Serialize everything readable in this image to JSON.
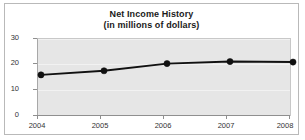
{
  "chart_data": {
    "type": "line",
    "title": "Net Income History",
    "subtitle": "(in millions of dollars)",
    "title_line1": "Net Income History",
    "title_line2": "(in millions of dollars)",
    "xlabel": "",
    "ylabel": "",
    "categories": [
      "2004",
      "2005",
      "2006",
      "2007",
      "2008"
    ],
    "values": [
      16.8,
      18.4,
      21.2,
      22.0,
      21.8
    ],
    "series": [
      {
        "name": "Net Income",
        "values": [
          16.8,
          18.4,
          21.2,
          22.0,
          21.8
        ]
      }
    ],
    "ylim": [
      0,
      30
    ],
    "yticks": [
      0,
      10,
      20,
      30
    ],
    "ytick_labels": [
      "0",
      "10",
      "20",
      "30"
    ],
    "xtick_labels": [
      "2004",
      "2005",
      "2006",
      "2007",
      "2008"
    ],
    "grid": true,
    "grid_axis": "y",
    "legend": false,
    "legend_position": "none",
    "markers": true,
    "colors": {
      "line": "#111111",
      "marker": "#111111",
      "plot_background": "#e6e6e6",
      "figure_background": "#ffffff",
      "gridline": "#f2f2f2",
      "axis": "#8f8f8f",
      "border": "#b9b9b9",
      "text": "#333333",
      "title_text": "#1a1a1a"
    }
  }
}
